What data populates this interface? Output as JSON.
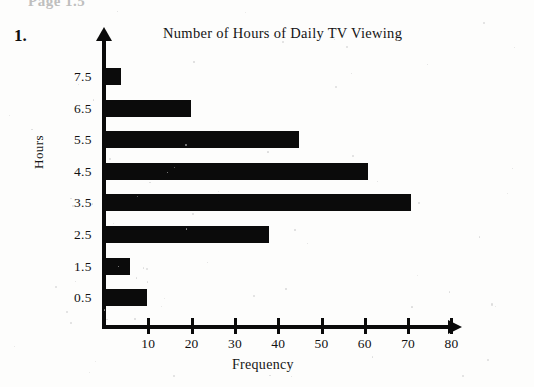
{
  "page": {
    "header_strip": "Page 1.5",
    "problem_number": "1."
  },
  "chart_data": {
    "type": "bar",
    "orientation": "horizontal",
    "title": "Number of Hours of Daily TV Viewing",
    "xlabel": "Frequency",
    "ylabel": "Hours",
    "categories": [
      "0.5",
      "1.5",
      "2.5",
      "3.5",
      "4.5",
      "5.5",
      "6.5",
      "7.5"
    ],
    "values": [
      10,
      6,
      38,
      71,
      61,
      45,
      20,
      4
    ],
    "xlim": [
      0,
      80
    ],
    "xticks": [
      10,
      20,
      30,
      40,
      50,
      60,
      70,
      80
    ],
    "xtick_labels": [
      "10",
      "20",
      "30",
      "40",
      "50",
      "60",
      "70",
      "80"
    ],
    "ytick_labels": [
      "7.5",
      "6.5",
      "5.5",
      "4.5",
      "3.5",
      "2.5",
      "1.5",
      "0.5"
    ],
    "grid": false,
    "legend": null,
    "bar_color": "#0b0b0b",
    "axis_color": "#0a0a0a"
  }
}
